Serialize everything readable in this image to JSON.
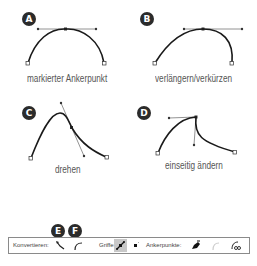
{
  "panels": [
    {
      "badge": "A",
      "caption": "markierter Ankerpunkt"
    },
    {
      "badge": "B",
      "caption": "verlängern/verkürzen"
    },
    {
      "badge": "C",
      "caption": "drehen"
    },
    {
      "badge": "D",
      "caption": "einseitig ändern"
    }
  ],
  "toolbar": {
    "convert_label": "Konvertieren:",
    "handles_label": "Griffe:",
    "anchors_label": "Ankerpunkte:",
    "badge_e": "E",
    "badge_f": "F",
    "icons": {
      "convert_smooth": "convert-to-corner-icon",
      "convert_corner": "convert-to-smooth-icon",
      "show_handles_multiple": "show-handles-multiple-icon",
      "hide_handles_multiple": "hide-handles-multiple-icon",
      "remove_anchor": "remove-anchor-icon",
      "connect_endpoints": "connect-endpoints-icon",
      "cut_path": "cut-path-icon"
    }
  },
  "colors": {
    "curve": "#1a1a1a",
    "handle": "#777777",
    "badge": "#2b2b2b",
    "active_button": "#c8c8c8"
  }
}
